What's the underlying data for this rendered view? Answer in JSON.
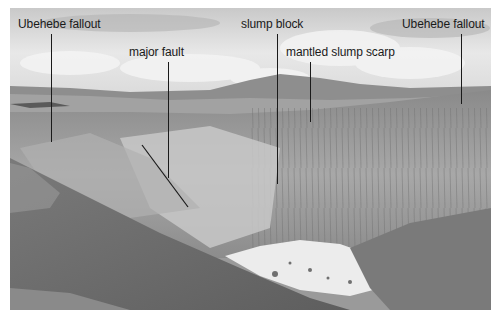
{
  "figure": {
    "type": "annotated grayscale photograph",
    "annotations": [
      {
        "id": "ubehebe-fallout-left",
        "text": "Ubehebe fallout"
      },
      {
        "id": "major-fault",
        "text": "major fault"
      },
      {
        "id": "slump-block",
        "text": "slump block"
      },
      {
        "id": "mantled-slump-scarp",
        "text": "mantled slump scarp"
      },
      {
        "id": "ubehebe-fallout-right",
        "text": "Ubehebe fallout"
      }
    ]
  },
  "colors": {
    "label_text": "#1a1a1a",
    "leader_line": "#1a1a1a",
    "sky": "#e4e4e4",
    "crater_wall": "#9c9c9c",
    "crater_floor": "#ececec",
    "foreground": "#6e6e6e"
  }
}
